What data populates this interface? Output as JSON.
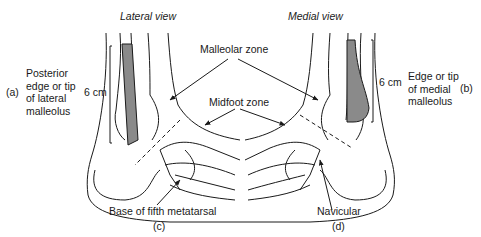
{
  "views": {
    "lateral": {
      "title": "Lateral view",
      "panel": "(a)",
      "caption_panel": "(c)"
    },
    "medial": {
      "title": "Medial view",
      "panel": "(b)",
      "caption_panel": "(d)"
    }
  },
  "labels": {
    "lateral_landmark": [
      "Posterior",
      "edge or tip",
      "of lateral",
      "malleolus"
    ],
    "medial_landmark": [
      "Edge or tip",
      "of medial",
      "malleolus"
    ],
    "measure_left": "6 cm",
    "measure_right": "6 cm",
    "malleolar_zone": "Malleolar zone",
    "midfoot_zone": "Midfoot zone",
    "base_fifth_metatarsal": "Base of fifth metatarsal",
    "navicular": "Navicular"
  },
  "colors": {
    "line": "#1a1a1a",
    "shade": "#8a8a8a"
  }
}
